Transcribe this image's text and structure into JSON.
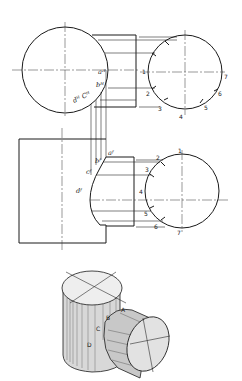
{
  "figure": {
    "top_view": {
      "labels": {
        "aH": "aᴴ",
        "bH": "bᴴ",
        "dHcH": "dᴴ Cᴴ"
      },
      "points": [
        "1",
        "2",
        "3",
        "4",
        "5",
        "6",
        "7"
      ]
    },
    "front_view": {
      "labels": {
        "aF": "aᶠ",
        "bF": "bᶠ",
        "cF": "cᶠ",
        "dF": "dᶠ"
      },
      "points": [
        "1",
        "2",
        "3",
        "4",
        "5",
        "6",
        "7"
      ]
    },
    "pictorial": {
      "labels": [
        "D",
        "C",
        "B",
        "A"
      ]
    }
  },
  "colors": {
    "ink": "#1a1a1a",
    "paper": "#ffffff"
  }
}
